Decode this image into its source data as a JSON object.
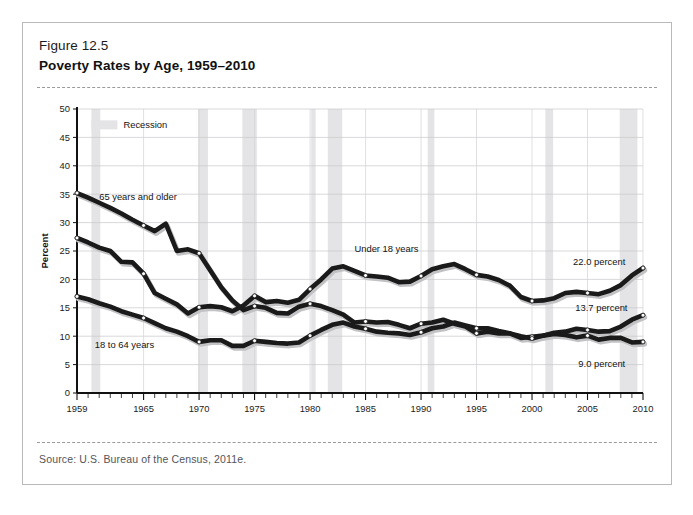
{
  "figure": {
    "number": "Figure 12.5",
    "title": "Poverty Rates by Age, 1959–2010",
    "source": "Source: U.S. Bureau of the Census, 2011e."
  },
  "legend": {
    "recession_label": "Recession",
    "recession_color": "#e4e4e6"
  },
  "annotations": {
    "under18_label": "Under 18 years",
    "older65_label": "65 years and older",
    "adults_label": "18 to 64 years",
    "under18_end": "22.0 percent",
    "adults_end": "13.7 percent",
    "older65_end": "9.0 percent"
  },
  "chart_data": {
    "type": "line",
    "xlabel": "",
    "ylabel": "Percent",
    "xlim": [
      1959,
      2010
    ],
    "ylim": [
      0,
      50
    ],
    "yticks": [
      0,
      5,
      10,
      15,
      20,
      25,
      30,
      35,
      40,
      45,
      50
    ],
    "xticks": [
      1959,
      1965,
      1970,
      1975,
      1980,
      1985,
      1990,
      1995,
      2000,
      2005,
      2010
    ],
    "grid": true,
    "legend_position": "top-left",
    "line_color": "#1a1a1a",
    "marker_color": "#ffffff",
    "x": [
      1959,
      1960,
      1961,
      1962,
      1963,
      1964,
      1965,
      1966,
      1967,
      1968,
      1969,
      1970,
      1971,
      1972,
      1973,
      1974,
      1975,
      1976,
      1977,
      1978,
      1979,
      1980,
      1981,
      1982,
      1983,
      1984,
      1985,
      1986,
      1987,
      1988,
      1989,
      1990,
      1991,
      1992,
      1993,
      1994,
      1995,
      1996,
      1997,
      1998,
      1999,
      2000,
      2001,
      2002,
      2003,
      2004,
      2005,
      2006,
      2007,
      2008,
      2009,
      2010
    ],
    "series": [
      {
        "name": "65 years and older",
        "values": [
          35.2,
          34.4,
          33.5,
          32.6,
          31.6,
          30.5,
          29.5,
          28.5,
          29.8,
          25.0,
          25.3,
          24.6,
          21.6,
          18.6,
          16.3,
          14.6,
          15.3,
          15.0,
          14.1,
          14.0,
          15.2,
          15.7,
          15.3,
          14.6,
          13.8,
          12.4,
          12.6,
          12.4,
          12.5,
          12.0,
          11.4,
          12.2,
          12.4,
          12.9,
          12.2,
          11.7,
          10.5,
          10.8,
          10.5,
          10.5,
          9.7,
          9.9,
          10.1,
          10.4,
          10.2,
          9.8,
          10.1,
          9.4,
          9.7,
          9.7,
          8.9,
          9.0
        ],
        "end_label": "9.0 percent"
      },
      {
        "name": "Under 18 years",
        "values": [
          27.3,
          26.5,
          25.6,
          25.0,
          23.1,
          23.0,
          21.0,
          17.6,
          16.6,
          15.6,
          14.0,
          15.1,
          15.3,
          15.1,
          14.4,
          15.4,
          17.1,
          16.0,
          16.2,
          15.9,
          16.4,
          18.3,
          20.0,
          21.9,
          22.3,
          21.5,
          20.7,
          20.5,
          20.3,
          19.5,
          19.6,
          20.6,
          21.8,
          22.3,
          22.7,
          21.8,
          20.8,
          20.5,
          19.9,
          18.9,
          16.9,
          16.2,
          16.3,
          16.7,
          17.6,
          17.8,
          17.6,
          17.4,
          18.0,
          19.0,
          20.7,
          22.0
        ],
        "end_label": "22.0 percent"
      },
      {
        "name": "18 to 64 years",
        "values": [
          17.0,
          16.5,
          15.8,
          15.2,
          14.4,
          13.8,
          13.2,
          12.3,
          11.4,
          10.8,
          10.0,
          9.0,
          9.3,
          9.3,
          8.3,
          8.3,
          9.2,
          9.0,
          8.8,
          8.7,
          8.9,
          10.1,
          11.1,
          12.0,
          12.4,
          11.7,
          11.3,
          10.8,
          10.6,
          10.5,
          10.2,
          10.7,
          11.4,
          11.7,
          12.4,
          11.9,
          11.4,
          11.4,
          10.9,
          10.5,
          10.0,
          9.6,
          10.1,
          10.6,
          10.8,
          11.3,
          11.1,
          10.8,
          10.9,
          11.7,
          12.9,
          13.7
        ],
        "end_label": "13.7 percent"
      }
    ],
    "marker_years": [
      1959,
      1965,
      1970,
      1975,
      1980,
      1985,
      1990,
      1995,
      2000,
      2005,
      2010
    ],
    "recessions": [
      {
        "start": 1960.3,
        "end": 1961.1
      },
      {
        "start": 1969.9,
        "end": 1970.8
      },
      {
        "start": 1973.9,
        "end": 1975.2
      },
      {
        "start": 1980.1,
        "end": 1980.5
      },
      {
        "start": 1981.6,
        "end": 1982.9
      },
      {
        "start": 1990.6,
        "end": 1991.2
      },
      {
        "start": 2001.2,
        "end": 2001.9
      },
      {
        "start": 2007.9,
        "end": 2009.5
      }
    ]
  }
}
